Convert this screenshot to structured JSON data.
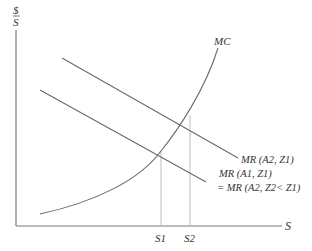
{
  "diagram": {
    "type": "economics-marginal-analysis",
    "y_axis": {
      "label_top": "$",
      "label_bottom": "S"
    },
    "x_axis": {
      "label": "S",
      "ticks": [
        "S1",
        "S2"
      ]
    },
    "curves": {
      "mc": {
        "label": "MC"
      },
      "mr_upper": {
        "label": "MR (A2, Z1)"
      },
      "mr_lower": {
        "label_line1": "MR (A1, Z1)",
        "label_line2": "= MR (A2, Z2< Z1)"
      }
    }
  }
}
